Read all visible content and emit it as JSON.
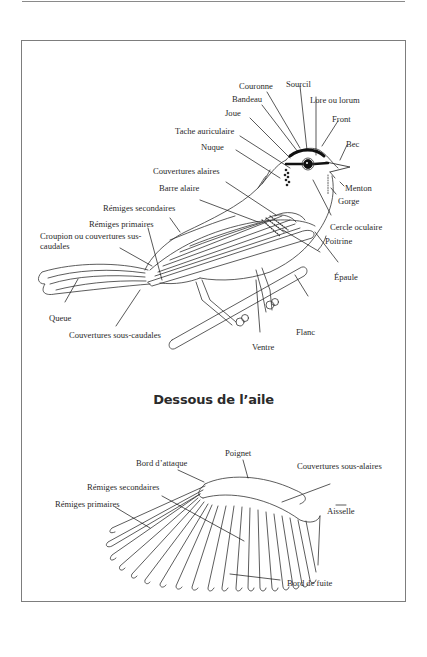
{
  "page": {
    "top_rule": true,
    "frame": true
  },
  "bird_diagram": {
    "labels": {
      "couronne": "Couronne",
      "sourcil": "Sourcil",
      "bandeau": "Bandeau",
      "lore": "Lore ou lorum",
      "joue": "Joue",
      "front": "Front",
      "tache_auriculaire": "Tache auriculaire",
      "bec": "Bec",
      "nuque": "Nuque",
      "menton": "Menton",
      "couvertures_alaires": "Couvertures alaires",
      "gorge": "Gorge",
      "barre_alaire": "Barre alaire",
      "remiges_secondaires": "Rémiges secondaires",
      "cercle_oculaire": "Cercle oculaire",
      "remiges_primaires": "Rémiges primaires",
      "poitrine": "Poitrine",
      "croupion": "Croupion ou couvertures sus-caudales",
      "epaule": "Épaule",
      "queue": "Queue",
      "flanc": "Flanc",
      "couvertures_sous_caudales": "Couvertures sous-caudales",
      "ventre": "Ventre"
    }
  },
  "wing_diagram": {
    "title": "Dessous de l’aile",
    "labels": {
      "poignet": "Poignet",
      "bord_attaque": "Bord d’attaque",
      "couvertures_sous_alaires": "Couvertures sous-alaires",
      "remiges_secondaires": "Rémiges secondaires",
      "remiges_primaires": "Rémiges primaires",
      "aisselle": "Aisselle",
      "bord_fuite": "Bord de fuite"
    }
  }
}
